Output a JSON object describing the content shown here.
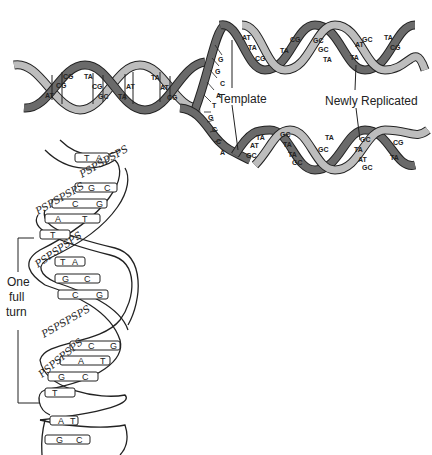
{
  "diagram": {
    "labels": {
      "template": "Template",
      "newly_replicated": "Newly Replicated",
      "one_full_turn": [
        "One",
        "full",
        "turn"
      ]
    },
    "colors": {
      "dark_strand": "#6a6a6a",
      "light_strand": "#bdbdbd",
      "line": "#222222",
      "background": "#ffffff"
    },
    "parent_helix_pairs": [
      "AT",
      "CG",
      "CG",
      "TA",
      "CG",
      "GC",
      "TA",
      "AT",
      "TA",
      "AT",
      "CG"
    ],
    "fork_upper_bases": [
      "G",
      "G",
      "A",
      "C",
      "T",
      "G",
      "G",
      "A",
      "A"
    ],
    "fork_lower_bases": [
      "T",
      "T",
      "G",
      "C",
      "C",
      "A",
      "T"
    ],
    "upper_daughter_pairs": [
      "AT",
      "TA",
      "CG",
      "CG",
      "TA",
      "A",
      "GC",
      "GC",
      "TA",
      "TA",
      "AT",
      "GC",
      "TA",
      "CG"
    ],
    "lower_daughter_pairs": [
      "TA",
      "AT",
      "GC",
      "GC",
      "TA",
      "TA",
      "GC",
      "TA",
      "GC",
      "GC",
      "TA",
      "AT",
      "GC",
      "TA",
      "CG"
    ],
    "ladder_rungs": [
      [
        "T",
        "A"
      ],
      [
        "G",
        "C"
      ],
      [
        "C",
        "G"
      ],
      [
        "A",
        "T"
      ],
      [
        "T",
        "A"
      ],
      [
        "T",
        "A"
      ],
      [
        "G",
        "C"
      ],
      [
        "C",
        "G"
      ],
      [
        "C",
        "G"
      ],
      [
        "A",
        "T"
      ],
      [
        "G",
        "C"
      ],
      [
        "T",
        "A"
      ],
      [
        "A",
        "T"
      ],
      [
        "G",
        "C"
      ]
    ],
    "backbone_letters": "PSPSPSPS"
  }
}
